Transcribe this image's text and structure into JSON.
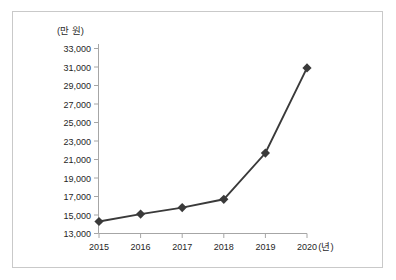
{
  "chart_data": {
    "type": "line",
    "title": "",
    "subtitle": "",
    "xlabel": "(년)",
    "ylabel": "(만 원)",
    "categories": [
      "2015",
      "2016",
      "2017",
      "2018",
      "2019",
      "2020"
    ],
    "x": [
      2015,
      2016,
      2017,
      2018,
      2019,
      2020
    ],
    "values": [
      14300,
      15100,
      15800,
      16700,
      21700,
      30900
    ],
    "series": [
      {
        "name": "",
        "values": [
          14300,
          15100,
          15800,
          16700,
          21700,
          30900
        ]
      }
    ],
    "ylim": [
      13000,
      33000
    ],
    "ytick_labels": [
      "33,000",
      "31,000",
      "29,000",
      "27,000",
      "25,000",
      "23,000",
      "21,000",
      "19,000",
      "17,000",
      "15,000",
      "13,000"
    ],
    "ytick_values": [
      33000,
      31000,
      29000,
      27000,
      25000,
      23000,
      21000,
      19000,
      17000,
      15000,
      13000
    ],
    "xtick_labels": [
      "2015",
      "2016",
      "2017",
      "2018",
      "2019",
      "2020"
    ],
    "grid": false,
    "legend": "none",
    "marker": "diamond",
    "line_color": "#3a3a3a",
    "marker_color": "#3a3a3a",
    "axis_color": "#9a9a9a",
    "background_color": "#ffffff",
    "border_color": "#c9c9c9",
    "annotations": []
  },
  "axes": {
    "y_unit_label": "(만 원)",
    "x_unit_label": "(년)"
  }
}
